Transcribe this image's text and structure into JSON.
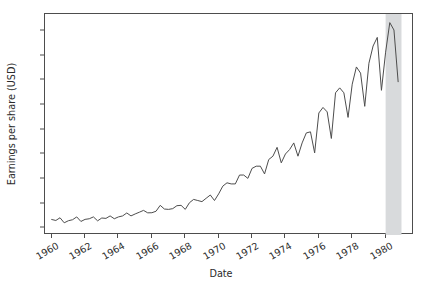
{
  "figure": {
    "width": 426,
    "height": 289,
    "background": "#ffffff",
    "line_color": "#4d4d4d",
    "span_color": "#d8dadc"
  },
  "chart_data": {
    "type": "line",
    "title": "",
    "xlabel": "Date",
    "ylabel": "Earnings per share (USD)",
    "xlim": [
      1959.6,
      1981.7
    ],
    "ylim": [
      -0.55,
      17.4
    ],
    "grid": false,
    "legend": null,
    "xticks": [
      1960,
      1962,
      1964,
      1966,
      1968,
      1970,
      1972,
      1974,
      1976,
      1978,
      1980
    ],
    "xticklabels": [
      "1960",
      "1962",
      "1964",
      "1966",
      "1968",
      "1970",
      "1972",
      "1974",
      "1976",
      "1978",
      "1980"
    ],
    "xtick_rotation": -30,
    "yticks": [
      0,
      2,
      4,
      6,
      8,
      10,
      12,
      14,
      16
    ],
    "yticklabels": [
      "0",
      "2",
      "4",
      "6",
      "8",
      "10",
      "12",
      "14",
      "16"
    ],
    "annotations": [
      {
        "type": "vspan",
        "name": "shaded-band",
        "x0": 1980.0,
        "x1": 1980.95,
        "color": "#d8dadc"
      }
    ],
    "series": [
      {
        "name": "Quarterly earnings per share",
        "color": "#4d4d4d",
        "linewidth": 1.0,
        "x": [
          1960.0,
          1960.25,
          1960.5,
          1960.75,
          1961.0,
          1961.25,
          1961.5,
          1961.75,
          1962.0,
          1962.25,
          1962.5,
          1962.75,
          1963.0,
          1963.25,
          1963.5,
          1963.75,
          1964.0,
          1964.25,
          1964.5,
          1964.75,
          1965.0,
          1965.25,
          1965.5,
          1965.75,
          1966.0,
          1966.25,
          1966.5,
          1966.75,
          1967.0,
          1967.25,
          1967.5,
          1967.75,
          1968.0,
          1968.25,
          1968.5,
          1968.75,
          1969.0,
          1969.25,
          1969.5,
          1969.75,
          1970.0,
          1970.25,
          1970.5,
          1970.75,
          1971.0,
          1971.25,
          1971.5,
          1971.75,
          1972.0,
          1972.25,
          1972.5,
          1972.75,
          1973.0,
          1973.25,
          1973.5,
          1973.75,
          1974.0,
          1974.25,
          1974.5,
          1974.75,
          1975.0,
          1975.25,
          1975.5,
          1975.75,
          1976.0,
          1976.25,
          1976.5,
          1976.75,
          1977.0,
          1977.25,
          1977.5,
          1977.75,
          1978.0,
          1978.25,
          1978.5,
          1978.75,
          1979.0,
          1979.25,
          1979.5,
          1979.75,
          1980.0,
          1980.25,
          1980.5,
          1980.75
        ],
        "y": [
          0.71,
          0.63,
          0.85,
          0.44,
          0.61,
          0.69,
          0.92,
          0.55,
          0.72,
          0.77,
          0.92,
          0.6,
          0.83,
          0.8,
          1.0,
          0.77,
          0.92,
          1.0,
          1.24,
          1.0,
          1.16,
          1.3,
          1.45,
          1.25,
          1.26,
          1.38,
          1.86,
          1.56,
          1.53,
          1.59,
          1.83,
          1.86,
          1.53,
          2.07,
          2.34,
          2.25,
          2.16,
          2.43,
          2.7,
          2.25,
          2.79,
          3.42,
          3.69,
          3.6,
          3.6,
          4.32,
          4.32,
          4.05,
          4.86,
          5.04,
          5.04,
          4.41,
          5.58,
          5.85,
          6.57,
          5.31,
          6.03,
          6.39,
          6.93,
          5.85,
          6.93,
          7.74,
          7.83,
          6.12,
          9.36,
          9.81,
          9.45,
          7.29,
          11.0,
          11.4,
          11.0,
          9.0,
          11.7,
          13.1,
          12.6,
          9.9,
          13.4,
          14.8,
          15.5,
          11.2,
          14.3,
          16.7,
          16.1,
          11.9
        ]
      }
    ]
  }
}
